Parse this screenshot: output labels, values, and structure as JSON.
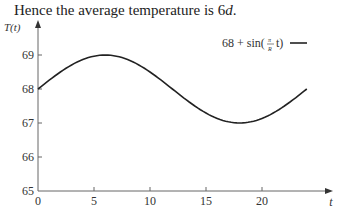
{
  "heading": {
    "prefix": "Hence the average temperature is 6",
    "var": "d",
    "suffix": "."
  },
  "chart_data": {
    "type": "line",
    "title": "",
    "xlabel": "t",
    "ylabel": "T(t)",
    "xlim": [
      0,
      24
    ],
    "ylim": [
      65,
      69.7
    ],
    "xticks": [
      0,
      5,
      10,
      15,
      20
    ],
    "yticks": [
      65,
      66,
      67,
      68,
      69
    ],
    "grid": false,
    "legend_position": "upper right",
    "series": [
      {
        "name": "68 + sin(π/R t)",
        "x": [
          0,
          2,
          4,
          6,
          8,
          10,
          12,
          14,
          16,
          18,
          20,
          22,
          24
        ],
        "values": [
          68,
          68.5,
          68.87,
          69,
          68.87,
          68.5,
          68,
          67.5,
          67.13,
          67,
          67.13,
          67.5,
          68
        ]
      }
    ]
  },
  "legend": {
    "label": "68 + sin(",
    "frac_num": "π",
    "frac_den": "R",
    "tail": "t)"
  }
}
